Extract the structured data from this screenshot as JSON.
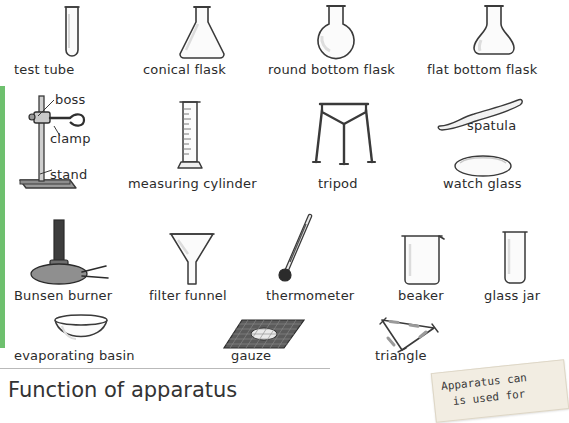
{
  "page": {
    "title": "Function of apparatus",
    "accent_color": "#6ec06e",
    "label_color": "#2b2b2b",
    "background": "#ffffff"
  },
  "note": {
    "line1": "Apparatus can",
    "line2": "is used for"
  },
  "apparatus": [
    {
      "key": "test-tube",
      "label": "test tube"
    },
    {
      "key": "conical-flask",
      "label": "conical flask"
    },
    {
      "key": "round-bottom-flask",
      "label": "round bottom flask"
    },
    {
      "key": "flat-bottom-flask",
      "label": "flat bottom flask"
    },
    {
      "key": "boss",
      "label": "boss"
    },
    {
      "key": "clamp",
      "label": "clamp"
    },
    {
      "key": "stand",
      "label": "stand"
    },
    {
      "key": "measuring-cylinder",
      "label": "measuring cylinder"
    },
    {
      "key": "tripod",
      "label": "tripod"
    },
    {
      "key": "spatula",
      "label": "spatula"
    },
    {
      "key": "watch-glass",
      "label": "watch glass"
    },
    {
      "key": "bunsen-burner",
      "label": "Bunsen burner"
    },
    {
      "key": "filter-funnel",
      "label": "filter funnel"
    },
    {
      "key": "thermometer",
      "label": "thermometer"
    },
    {
      "key": "beaker",
      "label": "beaker"
    },
    {
      "key": "glass-jar",
      "label": "glass jar"
    },
    {
      "key": "evaporating-basin",
      "label": "evaporating basin"
    },
    {
      "key": "gauze",
      "label": "gauze"
    },
    {
      "key": "triangle",
      "label": "triangle"
    }
  ]
}
